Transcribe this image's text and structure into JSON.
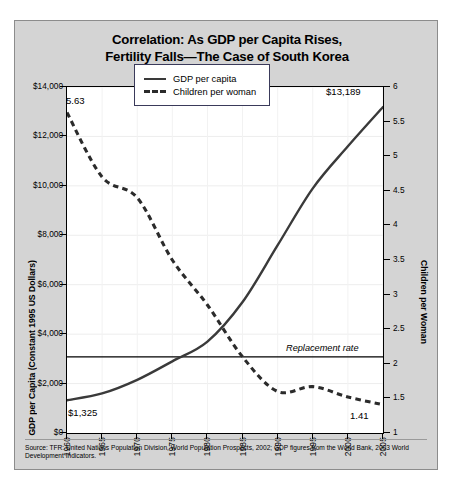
{
  "title": {
    "line1": "Correlation: As GDP per Capita Rises,",
    "line2": "Fertility Falls—The Case of South Korea"
  },
  "legend": {
    "items": [
      {
        "label": "GDP per capita",
        "style": "solid"
      },
      {
        "label": "Children per woman",
        "style": "dashed"
      }
    ]
  },
  "annotations": {
    "gdp_start": "$1,325",
    "gdp_end": "$13,189",
    "tfr_start": "5.63",
    "tfr_end": "1.41",
    "replacement_rate": "Replacement rate"
  },
  "source": "Source: TFR: United Nations Population Division, World Population Prospects, 2002; GDP figures from the World Bank, 2003 World Development Indicators.",
  "chart_data": {
    "type": "line",
    "title": "Correlation: As GDP per Capita Rises, Fertility Falls—The Case of South Korea",
    "xlabel": "",
    "x": [
      1960,
      1965,
      1970,
      1975,
      1980,
      1985,
      1990,
      1995,
      2000,
      2005
    ],
    "xlim": [
      1960,
      2005
    ],
    "xticks": [
      "1960",
      "1965",
      "1970",
      "1975",
      "1980",
      "1985",
      "1990",
      "1995",
      "2000",
      "2005"
    ],
    "grid": true,
    "legend_position": "upper-center",
    "axes": [
      {
        "id": "left",
        "label": "GDP per Capita (Constant 1995 US Dollars)",
        "lim": [
          0,
          14000
        ],
        "ticks": [
          "$0",
          "$2,000",
          "$4,000",
          "$6,000",
          "$8,000",
          "$10,000",
          "$12,000",
          "$14,000"
        ],
        "tick_values": [
          0,
          2000,
          4000,
          6000,
          8000,
          10000,
          12000,
          14000
        ]
      },
      {
        "id": "right",
        "label": "Children per Woman",
        "lim": [
          1,
          6
        ],
        "ticks": [
          "1",
          "1.5",
          "2",
          "2.5",
          "3",
          "3.5",
          "4",
          "4.5",
          "5",
          "5.5",
          "6"
        ],
        "tick_values": [
          1,
          1.5,
          2,
          2.5,
          3,
          3.5,
          4,
          4.5,
          5,
          5.5,
          6
        ]
      }
    ],
    "series": [
      {
        "name": "GDP per capita",
        "axis": "left",
        "style": "solid",
        "color": "#3a3a3a",
        "values": [
          1325,
          1600,
          2150,
          2900,
          3700,
          5300,
          7600,
          9900,
          11600,
          13189
        ],
        "start_label": "$1,325",
        "end_label": "$13,189"
      },
      {
        "name": "Children per woman",
        "axis": "right",
        "style": "dashed",
        "color": "#2b2b2b",
        "values": [
          5.63,
          4.7,
          4.4,
          3.5,
          2.85,
          2.1,
          1.6,
          1.67,
          1.52,
          1.41
        ],
        "start_label": "5.63",
        "end_label": "1.41"
      }
    ],
    "annotations": [
      {
        "text": "Replacement rate",
        "type": "hline",
        "axis": "right",
        "value": 2.1
      }
    ]
  }
}
